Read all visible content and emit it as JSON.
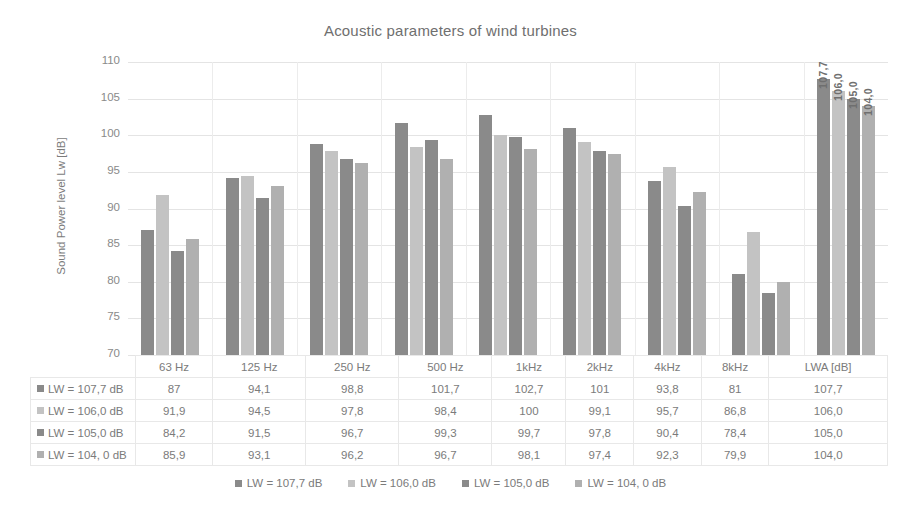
{
  "chart_data": {
    "type": "bar",
    "title": "Acoustic parameters of wind turbines",
    "xlabel": "",
    "ylabel": "Sound Power level Lw [dB]",
    "ylim": [
      70,
      110
    ],
    "ytick_step": 5,
    "yticks": [
      110,
      105,
      100,
      95,
      90,
      85,
      80,
      75,
      70
    ],
    "grid": true,
    "legend_position": "bottom",
    "categories": [
      "63 Hz",
      "125 Hz",
      "250 Hz",
      "500 Hz",
      "1kHz",
      "2kHz",
      "4kHz",
      "8kHz",
      "LWA [dB]"
    ],
    "series": [
      {
        "name": "LW = 107,7 dB",
        "color": "#8a8a8a",
        "values": [
          87,
          94.1,
          98.8,
          101.7,
          102.7,
          101,
          93.8,
          81,
          107.7
        ],
        "display_values": [
          "87",
          "94,1",
          "98,8",
          "101,7",
          "102,7",
          "101",
          "93,8",
          "81",
          "107,7"
        ]
      },
      {
        "name": "LW = 106,0 dB",
        "color": "#c3c3c3",
        "values": [
          91.9,
          94.5,
          97.8,
          98.4,
          100,
          99.1,
          95.7,
          86.8,
          106.0
        ],
        "display_values": [
          "91,9",
          "94,5",
          "97,8",
          "98,4",
          "100",
          "99,1",
          "95,7",
          "86,8",
          "106,0"
        ]
      },
      {
        "name": "LW = 105,0 dB",
        "color": "#8a8a8a",
        "values": [
          84.2,
          91.5,
          96.7,
          99.3,
          99.7,
          97.8,
          90.4,
          78.4,
          105.0
        ],
        "display_values": [
          "84,2",
          "91,5",
          "96,7",
          "99,3",
          "99,7",
          "97,8",
          "90,4",
          "78,4",
          "105,0"
        ]
      },
      {
        "name": "LW = 104, 0 dB",
        "color": "#b0b0b0",
        "values": [
          85.9,
          93.1,
          96.2,
          96.7,
          98.1,
          97.4,
          92.3,
          79.9,
          104.0
        ],
        "display_values": [
          "85,9",
          "93,1",
          "96,2",
          "96,7",
          "98,1",
          "97,4",
          "92,3",
          "79,9",
          "104,0"
        ]
      }
    ],
    "data_labels": {
      "category": "LWA [dB]",
      "values": [
        "107,7",
        "106,0",
        "105,0",
        "104,0"
      ]
    }
  },
  "data_table": {
    "corner": "",
    "column_headers": [
      "63 Hz",
      "125 Hz",
      "250 Hz",
      "500 Hz",
      "1kHz",
      "2kHz",
      "4kHz",
      "8kHz",
      "LWA [dB]"
    ],
    "rows": [
      {
        "label": "LW = 107,7 dB",
        "color": "#8a8a8a",
        "cells": [
          "87",
          "94,1",
          "98,8",
          "101,7",
          "102,7",
          "101",
          "93,8",
          "81",
          "107,7"
        ]
      },
      {
        "label": "LW = 106,0 dB",
        "color": "#c3c3c3",
        "cells": [
          "91,9",
          "94,5",
          "97,8",
          "98,4",
          "100",
          "99,1",
          "95,7",
          "86,8",
          "106,0"
        ]
      },
      {
        "label": "LW = 105,0 dB",
        "color": "#8a8a8a",
        "cells": [
          "84,2",
          "91,5",
          "96,7",
          "99,3",
          "99,7",
          "97,8",
          "90,4",
          "78,4",
          "105,0"
        ]
      },
      {
        "label": "LW = 104, 0 dB",
        "color": "#b0b0b0",
        "cells": [
          "85,9",
          "93,1",
          "96,2",
          "96,7",
          "98,1",
          "97,4",
          "92,3",
          "79,9",
          "104,0"
        ]
      }
    ]
  },
  "legend": {
    "items": [
      {
        "label": "LW = 107,7 dB",
        "color": "#8a8a8a"
      },
      {
        "label": "LW = 106,0 dB",
        "color": "#c3c3c3"
      },
      {
        "label": "LW = 105,0 dB",
        "color": "#8a8a8a"
      },
      {
        "label": "LW = 104, 0 dB",
        "color": "#b0b0b0"
      }
    ]
  },
  "colors": {
    "background": "#ffffff",
    "text": "#7b7b7b",
    "gridline": "#e4e4e4",
    "table_border": "#e8e8e8"
  }
}
